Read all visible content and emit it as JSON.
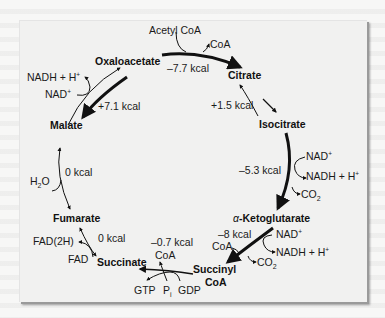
{
  "metabolites": {
    "oxaloacetate": "Oxaloacetate",
    "citrate": "Citrate",
    "isocitrate": "Isocitrate",
    "alpha_ketoglutarate_prefix": "α",
    "alpha_ketoglutarate": "-Ketoglutarate",
    "succinyl_coa_line1": "Succinyl",
    "succinyl_coa_line2": "CoA",
    "succinate": "Succinate",
    "fumarate": "Fumarate",
    "malate": "Malate"
  },
  "energies": {
    "oaa_to_citrate": "–7.7 kcal",
    "citrate_to_isocitrate": "+1.5 kcal",
    "isocitrate_to_akg": "–5.3 kcal",
    "akg_to_succinylcoa": "–8 kcal",
    "succinylcoa_to_succinate": "–0.7 kcal",
    "succinate_to_fumarate": "0 kcal",
    "fumarate_to_malate": "0 kcal",
    "malate_to_oaa": "+7.1 kcal"
  },
  "cofactors": {
    "acetyl_coa": "Acetyl CoA",
    "coa_out_citrate": "CoA",
    "nad_isocitrate": "NAD",
    "nadh_isocitrate": "NADH + H",
    "co2_isocitrate": "CO",
    "nad_akg": "NAD",
    "nadh_akg": "NADH + H",
    "coa_akg": "CoA",
    "co2_akg": "CO",
    "coa_succinyl": "CoA",
    "gtp": "GTP",
    "pi": "P",
    "pi_sub": "i",
    "gdp": "GDP",
    "fad2h": "FAD(2H)",
    "fad": "FAD",
    "h2o": "H",
    "h2o_sub": "2",
    "h2o_tail": "O",
    "nadh_malate": "NADH + H",
    "nad_malate": "NAD",
    "plus_sup": "+",
    "two_sub": "2"
  },
  "colors": {
    "arrow": "#111111",
    "text": "#1a1a1a",
    "panel": "#f1f1f0",
    "background": "#f7f7f6"
  }
}
